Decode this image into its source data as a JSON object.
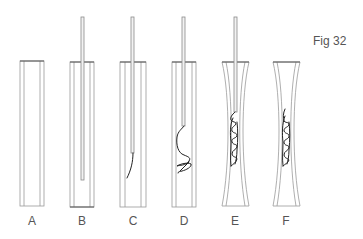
{
  "figure": {
    "title": "Fig 32",
    "panels": [
      {
        "id": "A",
        "label": "A",
        "shape": "straight",
        "has_rod": false,
        "wire": "none"
      },
      {
        "id": "B",
        "label": "B",
        "shape": "straight",
        "has_rod": true,
        "wire": "none"
      },
      {
        "id": "C",
        "label": "C",
        "shape": "straight",
        "has_rod": true,
        "wire": "curved-tip"
      },
      {
        "id": "D",
        "label": "D",
        "shape": "straight",
        "has_rod": true,
        "wire": "loop-knot"
      },
      {
        "id": "E",
        "label": "E",
        "shape": "hourglass",
        "has_rod": true,
        "wire": "coiled"
      },
      {
        "id": "F",
        "label": "F",
        "shape": "hourglass",
        "has_rod": false,
        "wire": "coiled"
      }
    ]
  },
  "colors": {
    "tube_stroke": "#9a9a9a",
    "wire": "#222222",
    "text": "#555555"
  }
}
